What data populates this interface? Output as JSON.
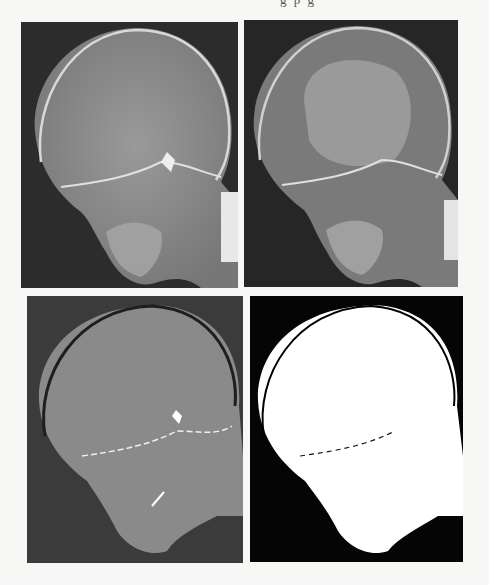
{
  "page": {
    "top_cutoff_text": "g p g",
    "figure": {
      "layout": "2x2 grid",
      "panels": [
        {
          "position": "top-left",
          "description": "Lateral skull X-ray, original grayscale",
          "bg_color": "#2a2a2a",
          "skull_fill": "#8e8e8e"
        },
        {
          "position": "top-right",
          "description": "Lateral skull X-ray, enhanced/quantized grayscale",
          "bg_color": "#252525",
          "skull_fill": "#7c7c7c",
          "center_fill": "#9a9a9a"
        },
        {
          "position": "bottom-left",
          "description": "Lateral skull X-ray, segmented two-level gray",
          "bg_color": "#3a3a3a",
          "skull_fill": "#8a8a8a"
        },
        {
          "position": "bottom-right",
          "description": "Lateral skull X-ray, binary threshold mask",
          "bg_color": "#050505",
          "skull_fill": "#ffffff"
        }
      ]
    }
  }
}
